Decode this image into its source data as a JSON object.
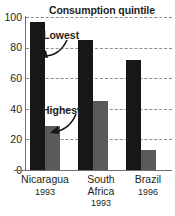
{
  "chart_data": {
    "type": "bar",
    "title": "Consumption quintile",
    "xlabel": "",
    "ylabel": "",
    "ylim": [
      0,
      100
    ],
    "yticks": [
      0,
      20,
      40,
      60,
      80,
      100
    ],
    "grid": true,
    "legend_position": "annotations-inline",
    "categories": [
      "Nicaragua",
      "South Africa",
      "Brazil"
    ],
    "category_years": [
      "1993",
      "1993",
      "1996"
    ],
    "series": [
      {
        "name": "Lowest",
        "values": [
          97,
          85,
          72
        ],
        "color": "#171717"
      },
      {
        "name": "Highest",
        "values": [
          29,
          45,
          13
        ],
        "color": "#5a5a5a"
      }
    ],
    "annotations": [
      {
        "text": "Lowest",
        "target_series": "Lowest"
      },
      {
        "text": "Highest",
        "target_series": "Highest"
      }
    ]
  },
  "axis": {
    "y_labels": [
      "100",
      "80",
      "60",
      "40",
      "20",
      "0"
    ]
  },
  "categories": [
    {
      "name": "Nicaragua",
      "year": "1993"
    },
    {
      "name": "South Africa",
      "year": "1993"
    },
    {
      "name": "Brazil",
      "year": "1996"
    }
  ],
  "annotations": {
    "lowest": "Lowest",
    "highest": "Highest"
  },
  "title": "Consumption quintile"
}
